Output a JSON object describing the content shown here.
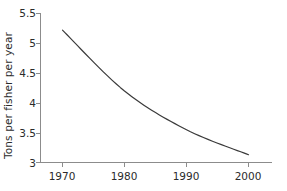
{
  "chart_data": {
    "type": "line",
    "title": "",
    "xlabel": "",
    "ylabel": "Tons per fisher per year",
    "x": [
      1970,
      1980,
      1990,
      2000
    ],
    "categories": [
      "1970",
      "1980",
      "1990",
      "2000"
    ],
    "values": [
      5.22,
      4.2,
      3.55,
      3.13
    ],
    "series": [
      {
        "name": "Tons per fisher per year",
        "values": [
          5.22,
          4.2,
          3.55,
          3.13
        ]
      }
    ],
    "xlim": [
      1970,
      2000
    ],
    "ylim": [
      3,
      5.5
    ],
    "xticks": [
      "1970",
      "1980",
      "1990",
      "2000"
    ],
    "yticks": [
      "3",
      "3.5",
      "4",
      "4.5",
      "5",
      "5.5"
    ],
    "grid": false,
    "legend": false,
    "legend_position": "none",
    "line_color": "#3a3a3a",
    "axis_color": "#8c8c8c",
    "text_color": "#2b2b2b",
    "background_color": "#ffffff"
  }
}
